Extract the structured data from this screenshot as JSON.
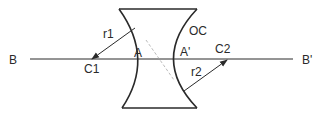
{
  "diagram": {
    "type": "biconcave-lens",
    "labels": {
      "B": "B",
      "B_prime": "B'",
      "C1": "C1",
      "C2": "C2",
      "A": "A",
      "A_prime": "A'",
      "r1": "r1",
      "r2": "r2",
      "OC": "OC"
    },
    "colors": {
      "stroke": "#2a2a2a",
      "dashed": "#aaaaaa",
      "background": "#ffffff"
    }
  }
}
